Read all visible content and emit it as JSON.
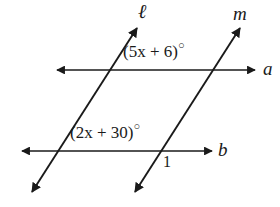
{
  "figure": {
    "type": "geometry-diagram",
    "background_color": "#ffffff",
    "stroke_color": "#1a1a1a"
  },
  "lines": {
    "horizontal": [
      {
        "id": "line-a",
        "label": "a",
        "label_x": 263,
        "label_y": 60,
        "x1": 57,
        "y1": 70,
        "x2": 255,
        "y2": 70,
        "arrows": "both"
      },
      {
        "id": "line-b",
        "label": "b",
        "label_x": 218,
        "label_y": 141,
        "x1": 22,
        "y1": 151,
        "x2": 212,
        "y2": 151,
        "arrows": "both"
      }
    ],
    "transversals": [
      {
        "id": "line-ell",
        "label": "ℓ",
        "label_x": 138,
        "label_y": 2,
        "x1": 32,
        "y1": 192,
        "x2": 137,
        "y2": 28,
        "arrows": "both"
      },
      {
        "id": "line-m",
        "label": "m",
        "label_x": 233,
        "label_y": 4,
        "x1": 135,
        "y1": 192,
        "x2": 240,
        "y2": 28,
        "arrows": "both"
      }
    ]
  },
  "angle_labels": [
    {
      "id": "angle-5x-plus-6",
      "text": "(5x + 6)",
      "degree": "○",
      "x": 123,
      "y": 42
    },
    {
      "id": "angle-2x-plus-30",
      "text": "(2x + 30)",
      "degree": "○",
      "x": 70,
      "y": 123
    },
    {
      "id": "angle-1",
      "text": "1",
      "x": 163,
      "y": 155
    }
  ],
  "intersections": [
    {
      "id": "ell-a",
      "x": 108,
      "y": 70
    },
    {
      "id": "m-a",
      "x": 213,
      "y": 70
    },
    {
      "id": "ell-b",
      "x": 62,
      "y": 151
    },
    {
      "id": "m-b",
      "x": 167,
      "y": 151
    }
  ]
}
